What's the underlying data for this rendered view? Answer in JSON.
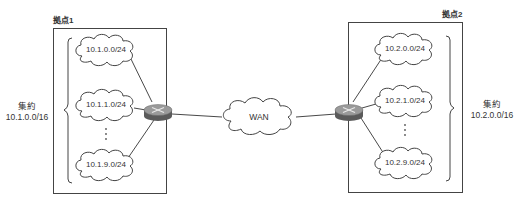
{
  "site1": {
    "title": "拠点1",
    "networks": [
      "10.1.0.0/24",
      "10.1.1.0/24",
      "10.1.9.0/24"
    ],
    "ellipsis": "⋮",
    "summary_label": "集約",
    "summary_prefix": "10.1.0.0/16"
  },
  "site2": {
    "title": "拠点2",
    "networks": [
      "10.2.0.0/24",
      "10.2.1.0/24",
      "10.2.9.0/24"
    ],
    "ellipsis": "⋮",
    "summary_label": "集約",
    "summary_prefix": "10.2.0.0/16"
  },
  "wan": {
    "label": "WAN"
  },
  "colors": {
    "line": "#333333",
    "box_border": "#444444",
    "router_top": "#9a9a9a",
    "router_side": "#5a5a5a",
    "router_mark": "#e8e8e8"
  }
}
